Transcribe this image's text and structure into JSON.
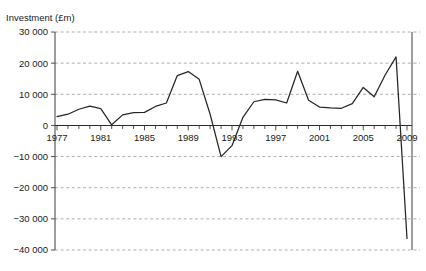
{
  "chart_data": {
    "type": "line",
    "title": "Investment (£m)",
    "xlabel": "",
    "ylabel": "Investment (£m)",
    "ylim": [
      -40000,
      30000
    ],
    "xlim": [
      1977,
      2009
    ],
    "grid": true,
    "legend": "none",
    "y_ticks": [
      30000,
      20000,
      10000,
      0,
      -10000,
      -20000,
      -30000,
      -40000
    ],
    "y_tick_labels": [
      "30 000",
      "20 000",
      "10 000",
      "0",
      "−10 000",
      "−20 000",
      "−30 000",
      "−40 000"
    ],
    "x_ticks": [
      1977,
      1978,
      1979,
      1980,
      1981,
      1982,
      1983,
      1984,
      1985,
      1986,
      1987,
      1988,
      1989,
      1990,
      1991,
      1992,
      1993,
      1994,
      1995,
      1996,
      1997,
      1998,
      1999,
      2000,
      2001,
      2002,
      2003,
      2004,
      2005,
      2006,
      2007,
      2008,
      2009
    ],
    "x_tick_labels": [
      "1977",
      "1981",
      "1985",
      "1989",
      "1993",
      "1997",
      "2001",
      "2005",
      "2009"
    ],
    "x_labelled_ticks": [
      1977,
      1981,
      1985,
      1989,
      1993,
      1997,
      2001,
      2005,
      2009
    ],
    "series": [
      {
        "name": "Investment",
        "color": "#262626",
        "x": [
          1977,
          1978,
          1979,
          1980,
          1981,
          1982,
          1983,
          1984,
          1985,
          1986,
          1987,
          1988,
          1989,
          1990,
          1991,
          1992,
          1993,
          1994,
          1995,
          1996,
          1997,
          1998,
          1999,
          2000,
          2001,
          2002,
          2003,
          2004,
          2005,
          2006,
          2007,
          2008,
          2009
        ],
        "values": [
          2800,
          3600,
          5200,
          6200,
          5400,
          200,
          3400,
          4100,
          4200,
          6100,
          7200,
          16000,
          17300,
          14800,
          3600,
          -10000,
          -6500,
          2600,
          7600,
          8400,
          8200,
          7200,
          17400,
          8100,
          5900,
          5600,
          5500,
          7000,
          12200,
          9200,
          16200,
          22000,
          -36300
        ]
      }
    ]
  },
  "colors": {
    "series_line": "#262626",
    "gridline": "#8c8c8c",
    "axis": "#3d3d3d",
    "text": "#1a1a1a",
    "background": "#ffffff"
  }
}
